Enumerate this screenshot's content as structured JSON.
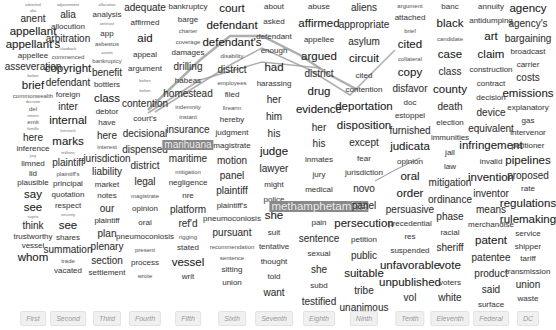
{
  "colors": {
    "highlight": "#8a8a8a",
    "link": "#9a9a9a",
    "label_bg": "#f0f0f0"
  },
  "columns": [
    {
      "label": "First",
      "x": 33,
      "words": [
        [
          "adverted",
          "tiny"
        ],
        [
          "alia",
          "tiny"
        ],
        [
          "anent",
          "s3"
        ],
        [
          "appellant",
          "s4"
        ],
        [
          "appellant's",
          "s4"
        ],
        [
          "appellee",
          "s2"
        ],
        [
          "asseveration",
          "s3"
        ],
        [
          "botton",
          "tiny"
        ],
        [
          "brief",
          "s4"
        ],
        [
          "commonwealth",
          "s1"
        ],
        [
          "decision",
          "tiny"
        ],
        [
          "del",
          "s1"
        ],
        [
          "emerit",
          "tiny"
        ],
        [
          "emit",
          "s1"
        ],
        [
          "famillo",
          "tiny"
        ],
        [
          "here",
          "s3"
        ],
        [
          "inference",
          "s2"
        ],
        [
          "jury",
          "tiny"
        ],
        [
          "limned",
          "s2"
        ],
        [
          "lid",
          "s2"
        ],
        [
          "plausible",
          "s2"
        ],
        [
          "say",
          "s4"
        ],
        [
          "see",
          "s4"
        ],
        [
          "suprie",
          "tiny"
        ],
        [
          "think",
          "s3"
        ],
        [
          "trustworthy",
          "s2"
        ],
        [
          "vessel",
          "s2"
        ],
        [
          "whom",
          "s4"
        ]
      ]
    },
    {
      "label": "Second",
      "x": 68,
      "words": [
        [
          "adjournment",
          "tiny"
        ],
        [
          "alia",
          "s3"
        ],
        [
          "allocution",
          "s2"
        ],
        [
          "arbitration",
          "s3"
        ],
        [
          "clawback",
          "tiny"
        ],
        [
          "commenced",
          "s1"
        ],
        [
          "copyright",
          "s4"
        ],
        [
          "defendant",
          "s3"
        ],
        [
          "foreign",
          "s2"
        ],
        [
          "inter",
          "s3"
        ],
        [
          "internal",
          "s4"
        ],
        [
          "livestock",
          "tiny"
        ],
        [
          "marks",
          "s4"
        ],
        [
          "millions",
          "tiny"
        ],
        [
          "plaintiff",
          "s3"
        ],
        [
          "plaintiff's",
          "s1"
        ],
        [
          "principal",
          "s2"
        ],
        [
          "quotation",
          "s2"
        ],
        [
          "respect",
          "s2"
        ],
        [
          "security",
          "tiny"
        ],
        [
          "see",
          "s4"
        ],
        [
          "shares",
          "s2"
        ],
        [
          "summation",
          "s3"
        ],
        [
          "trade",
          "s1"
        ],
        [
          "vacated",
          "s2"
        ]
      ]
    },
    {
      "label": "Third",
      "x": 107,
      "words": [
        [
          "allocation",
          "tiny"
        ],
        [
          "analysis",
          "s2"
        ],
        [
          "antitrust",
          "tiny"
        ],
        [
          "app",
          "s2"
        ],
        [
          "asbestos",
          "s1"
        ],
        [
          "assets",
          "tiny"
        ],
        [
          "bankruptcy",
          "s1"
        ],
        [
          "benefit",
          "s3"
        ],
        [
          "bottlers",
          "s2"
        ],
        [
          "class",
          "s4"
        ],
        [
          "debtor",
          "s2"
        ],
        [
          "have",
          "s2"
        ],
        [
          "here",
          "s3"
        ],
        [
          "interest",
          "s1"
        ],
        [
          "jurisdiction",
          "s3"
        ],
        [
          "liability",
          "s3"
        ],
        [
          "market",
          "s2"
        ],
        [
          "notes",
          "s2"
        ],
        [
          "our",
          "s3"
        ],
        [
          "plaintiff",
          "s2"
        ],
        [
          "plan",
          "s3"
        ],
        [
          "plenary",
          "s3"
        ],
        [
          "section",
          "s3"
        ],
        [
          "settlement",
          "s2"
        ]
      ]
    },
    {
      "label": "Fourth",
      "x": 145,
      "words": [
        [
          "adequate",
          "s3"
        ],
        [
          "affirmed",
          "s2"
        ],
        [
          "aid",
          "s4"
        ],
        [
          "appeal",
          "s2"
        ],
        [
          "argument",
          "s2"
        ],
        [
          "before",
          "tiny"
        ],
        [
          "bolton",
          "tiny"
        ],
        [
          "contention",
          "s3"
        ],
        [
          "court's",
          "s2"
        ],
        [
          "decisional",
          "s3"
        ],
        [
          "dispensed",
          "s3"
        ],
        [
          "district",
          "s3"
        ],
        [
          "legal",
          "s3"
        ],
        [
          "magistrate",
          "s1"
        ],
        [
          "opinion",
          "s2"
        ],
        [
          "oral",
          "s2"
        ],
        [
          "pneumoconiosis",
          "s2"
        ],
        [
          "present",
          "s1"
        ],
        [
          "process",
          "s2"
        ],
        [
          "wrote",
          "s1"
        ]
      ]
    },
    {
      "label": "Fifth",
      "x": 188,
      "words": [
        [
          "bankruptcy",
          "s2"
        ],
        [
          "barge",
          "s2"
        ],
        [
          "charter",
          "s1"
        ],
        [
          "coverage",
          "s1"
        ],
        [
          "damages",
          "s2"
        ],
        [
          "drilling",
          "s3"
        ],
        [
          "habeas",
          "s2"
        ],
        [
          "homestead",
          "s3"
        ],
        [
          "indemnity",
          "s1"
        ],
        [
          "instant",
          "s1"
        ],
        [
          "insurance",
          "s3"
        ],
        [
          "marihuana",
          "s3"
        ],
        [
          "maritime",
          "s3"
        ],
        [
          "mitigation",
          "s1"
        ],
        [
          "negligence",
          "s2"
        ],
        [
          "nre",
          "s2"
        ],
        [
          "platform",
          "s3"
        ],
        [
          "ref'd",
          "s3"
        ],
        [
          "rigging",
          "s1"
        ],
        [
          "stated",
          "s2"
        ],
        [
          "vessel",
          "s4"
        ],
        [
          "writ",
          "s2"
        ]
      ]
    },
    {
      "label": "Sixth",
      "x": 232,
      "words": [
        [
          "court",
          "s4"
        ],
        [
          "defendant",
          "s4"
        ],
        [
          "defendant's",
          "s4"
        ],
        [
          "disability",
          "s1"
        ],
        [
          "district",
          "s3"
        ],
        [
          "employees",
          "s1"
        ],
        [
          "filed",
          "s2"
        ],
        [
          "firearm",
          "s1"
        ],
        [
          "hereby",
          "s2"
        ],
        [
          "judgment",
          "s2"
        ],
        [
          "magistrate",
          "s2"
        ],
        [
          "motion",
          "s3"
        ],
        [
          "panel",
          "s3"
        ],
        [
          "plaintiff",
          "s3"
        ],
        [
          "plaintiff's",
          "s2"
        ],
        [
          "pneumoconiosis",
          "s2"
        ],
        [
          "pursuant",
          "s3"
        ],
        [
          "recommendation",
          "s1"
        ],
        [
          "sentence",
          "s1"
        ],
        [
          "sitting",
          "s2"
        ],
        [
          "union",
          "s2"
        ]
      ]
    },
    {
      "label": "Seventh",
      "x": 274,
      "words": [
        [
          "about",
          "s2"
        ],
        [
          "asked",
          "s2"
        ],
        [
          "defendant",
          "s2"
        ],
        [
          "enough",
          "s2"
        ],
        [
          "had",
          "s4"
        ],
        [
          "harassing",
          "s2"
        ],
        [
          "her",
          "s3"
        ],
        [
          "him",
          "s3"
        ],
        [
          "his",
          "s3"
        ],
        [
          "judge",
          "s4"
        ],
        [
          "lawyer",
          "s3"
        ],
        [
          "might",
          "s2"
        ],
        [
          "police",
          "s2"
        ],
        [
          "she",
          "s4"
        ],
        [
          "suit",
          "s2"
        ],
        [
          "tentative",
          "s2"
        ],
        [
          "thought",
          "s2"
        ],
        [
          "told",
          "s2"
        ],
        [
          "want",
          "s3"
        ]
      ]
    },
    {
      "label": "Eighth",
      "x": 319,
      "words": [
        [
          "abuse",
          "s2"
        ],
        [
          "affirmed",
          "s4"
        ],
        [
          "appellee",
          "s2"
        ],
        [
          "argued",
          "s4"
        ],
        [
          "district",
          "s3"
        ],
        [
          "drug",
          "s4"
        ],
        [
          "evidence",
          "s4"
        ],
        [
          "her",
          "s3"
        ],
        [
          "his",
          "s3"
        ],
        [
          "inmates",
          "s2"
        ],
        [
          "jury",
          "s2"
        ],
        [
          "medical",
          "s2"
        ],
        [
          "methamphetamine",
          "s4"
        ],
        [
          "pain",
          "s2"
        ],
        [
          "sentence",
          "s3"
        ],
        [
          "sexual",
          "s2"
        ],
        [
          "she",
          "s3"
        ],
        [
          "subd",
          "s2"
        ],
        [
          "testified",
          "s3"
        ]
      ]
    },
    {
      "label": "Ninth",
      "x": 364,
      "words": [
        [
          "aliens",
          "s3"
        ],
        [
          "appropriate",
          "s3"
        ],
        [
          "asylum",
          "s3"
        ],
        [
          "circuit",
          "s4"
        ],
        [
          "cited",
          "s2"
        ],
        [
          "contention",
          "s2"
        ],
        [
          "deportation",
          "s4"
        ],
        [
          "disposition",
          "s4"
        ],
        [
          "except",
          "s3"
        ],
        [
          "fear",
          "s2"
        ],
        [
          "jurisdiction",
          "s2"
        ],
        [
          "novo",
          "s3"
        ],
        [
          "panel",
          "s3"
        ],
        [
          "persecution",
          "s4"
        ],
        [
          "petition",
          "s2"
        ],
        [
          "public",
          "s3"
        ],
        [
          "suitable",
          "s4"
        ],
        [
          "tribe",
          "s3"
        ],
        [
          "unanimous",
          "s3"
        ]
      ]
    },
    {
      "label": "Tenth",
      "x": 410,
      "words": [
        [
          "argument",
          "s1"
        ],
        [
          "attached",
          "s2"
        ],
        [
          "brief",
          "s1"
        ],
        [
          "cited",
          "s4"
        ],
        [
          "collateral",
          "s1"
        ],
        [
          "copy",
          "s4"
        ],
        [
          "disfavor",
          "s3"
        ],
        [
          "doc",
          "s2"
        ],
        [
          "estoppel",
          "s2"
        ],
        [
          "furnished",
          "s3"
        ],
        [
          "judicata",
          "s4"
        ],
        [
          "opinion",
          "s2"
        ],
        [
          "oral",
          "s4"
        ],
        [
          "order",
          "s4"
        ],
        [
          "persuasive",
          "s3"
        ],
        [
          "precedential",
          "s2"
        ],
        [
          "res",
          "s2"
        ],
        [
          "suspended",
          "s2"
        ],
        [
          "unfavorable",
          "s4"
        ],
        [
          "unpublished",
          "s4"
        ],
        [
          "vol",
          "s3"
        ]
      ]
    },
    {
      "label": "Eleventh",
      "x": 450,
      "words": [
        [
          "banc",
          "s2"
        ],
        [
          "black",
          "s4"
        ],
        [
          "candidate",
          "s1"
        ],
        [
          "case",
          "s4"
        ],
        [
          "class",
          "s3"
        ],
        [
          "county",
          "s4"
        ],
        [
          "death",
          "s3"
        ],
        [
          "election",
          "s2"
        ],
        [
          "immunities",
          "s2"
        ],
        [
          "jail",
          "s2"
        ],
        [
          "law",
          "s2"
        ],
        [
          "mitigation",
          "s3"
        ],
        [
          "ordinance",
          "s3"
        ],
        [
          "phase",
          "s3"
        ],
        [
          "racial",
          "s2"
        ],
        [
          "sheriff",
          "s3"
        ],
        [
          "vote",
          "s4"
        ],
        [
          "voters",
          "s2"
        ],
        [
          "white",
          "s3"
        ]
      ]
    },
    {
      "label": "Federal",
      "x": 491,
      "words": [
        [
          "annuity",
          "s2"
        ],
        [
          "antidumping",
          "s2"
        ],
        [
          "art",
          "s4"
        ],
        [
          "claim",
          "s4"
        ],
        [
          "construction",
          "s2"
        ],
        [
          "contract",
          "s2"
        ],
        [
          "decision",
          "s2"
        ],
        [
          "device",
          "s3"
        ],
        [
          "equivalent",
          "s3"
        ],
        [
          "infringement",
          "s4"
        ],
        [
          "invalid",
          "s2"
        ],
        [
          "invention",
          "s4"
        ],
        [
          "inventor",
          "s3"
        ],
        [
          "means",
          "s3"
        ],
        [
          "merchandise",
          "s2"
        ],
        [
          "patent",
          "s4"
        ],
        [
          "patentee",
          "s3"
        ],
        [
          "product",
          "s3"
        ],
        [
          "said",
          "s3"
        ],
        [
          "surface",
          "s2"
        ]
      ]
    },
    {
      "label": "DC",
      "x": 528,
      "words": [
        [
          "agency",
          "s4"
        ],
        [
          "agency's",
          "s3"
        ],
        [
          "bargaining",
          "s3"
        ],
        [
          "broadcast",
          "s2"
        ],
        [
          "carrier",
          "s2"
        ],
        [
          "costs",
          "s3"
        ],
        [
          "emissions",
          "s4"
        ],
        [
          "explanatory",
          "s2"
        ],
        [
          "gas",
          "s2"
        ],
        [
          "intervenor",
          "s2"
        ],
        [
          "petitioner",
          "s2"
        ],
        [
          "pipelines",
          "s4"
        ],
        [
          "proposed",
          "s3"
        ],
        [
          "rate",
          "s2"
        ],
        [
          "regulations",
          "s4"
        ],
        [
          "rulemaking",
          "s4"
        ],
        [
          "service",
          "s2"
        ],
        [
          "shipper",
          "s2"
        ],
        [
          "tariff",
          "s2"
        ],
        [
          "transmission",
          "s2"
        ],
        [
          "union",
          "s3"
        ],
        [
          "waste",
          "s2"
        ]
      ]
    }
  ],
  "highlights": [
    {
      "column": 4,
      "word": "marihuana"
    },
    {
      "column": 7,
      "word": "methamphetamine"
    }
  ],
  "links": [
    {
      "points": [
        [
          167,
          72
        ],
        [
          232,
          35
        ],
        [
          284,
          45
        ],
        [
          322,
          40
        ],
        [
          358,
          10
        ]
      ]
    },
    {
      "points": [
        [
          160,
          92
        ],
        [
          232,
          55
        ],
        [
          300,
          45
        ],
        [
          345,
          55
        ],
        [
          410,
          5
        ]
      ]
    },
    {
      "points": [
        [
          70,
          316
        ],
        [
          180,
          270
        ],
        [
          330,
          242
        ],
        [
          400,
          190
        ]
      ]
    }
  ]
}
